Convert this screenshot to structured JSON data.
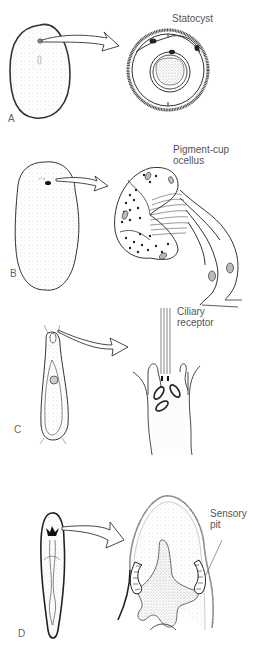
{
  "figure": {
    "panels": [
      {
        "id": "A",
        "letter": "A",
        "label": "Statocyst"
      },
      {
        "id": "B",
        "letter": "B",
        "label_line1": "Pigment-cup",
        "label_line2": "ocellus"
      },
      {
        "id": "C",
        "letter": "C",
        "label_line1": "Ciliary",
        "label_line2": "receptor"
      },
      {
        "id": "D",
        "letter": "D",
        "label_line1": "Sensory",
        "label_line2": "pit"
      }
    ]
  },
  "colors": {
    "ink": "#222222",
    "label": "#555555",
    "stipple": "#bbbbbb",
    "background": "#ffffff"
  }
}
